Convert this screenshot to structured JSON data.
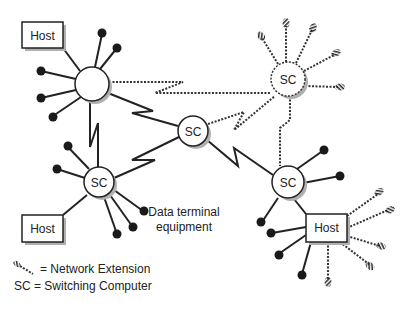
{
  "diagram": {
    "type": "network-topology",
    "nodes": {
      "host_top_left": {
        "label": "Host"
      },
      "hub_top_left": {
        "label": ""
      },
      "sc_top_right": {
        "label": "SC",
        "style": "dashed"
      },
      "sc_center": {
        "label": "SC"
      },
      "sc_lower_left": {
        "label": "SC"
      },
      "sc_lower_right": {
        "label": "SC"
      },
      "host_lower_left": {
        "label": "Host"
      },
      "host_lower_right": {
        "label": "Host"
      }
    },
    "annotation": {
      "line1": "Data terminal",
      "line2": "equipment"
    },
    "legend": {
      "network_extension": "= Network Extension",
      "switching_computer": "SC = Switching Computer"
    },
    "colors": {
      "line": "#222222",
      "shadow": "#aaaaaa",
      "background": "#ffffff"
    }
  }
}
